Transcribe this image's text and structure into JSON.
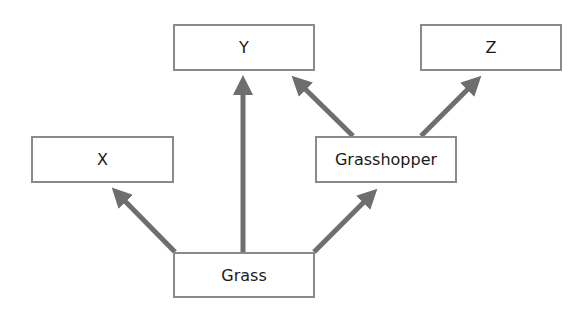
{
  "diagram": {
    "type": "food-web",
    "colors": {
      "arrow": "#6e6e6e",
      "box_border": "#8a8a8a",
      "text": "#1a1a1a"
    },
    "nodes": {
      "x": {
        "label": "X"
      },
      "y": {
        "label": "Y"
      },
      "z": {
        "label": "Z"
      },
      "grasshopper": {
        "label": "Grasshopper"
      },
      "grass": {
        "label": "Grass"
      }
    },
    "edges": [
      {
        "from": "Grass",
        "to": "X"
      },
      {
        "from": "Grass",
        "to": "Y"
      },
      {
        "from": "Grass",
        "to": "Grasshopper"
      },
      {
        "from": "Grasshopper",
        "to": "Y"
      },
      {
        "from": "Grasshopper",
        "to": "Z"
      }
    ]
  }
}
